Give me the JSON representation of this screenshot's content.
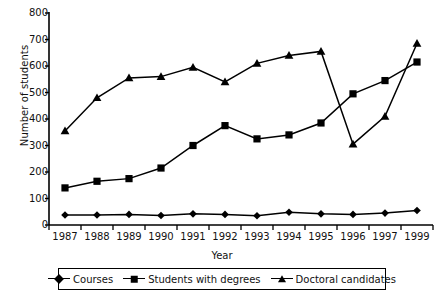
{
  "chart_data": {
    "type": "line",
    "title": "",
    "xlabel": "Year",
    "ylabel": "Number of students",
    "categories": [
      "1987",
      "1988",
      "1989",
      "1990",
      "1991",
      "1992",
      "1993",
      "1994",
      "1995",
      "1996",
      "1997",
      "1999"
    ],
    "ylim": [
      0,
      800
    ],
    "ytick_labels": [
      "0",
      "100",
      "200",
      "300",
      "400",
      "500",
      "600",
      "700",
      "800"
    ],
    "ytick_values": [
      0,
      100,
      200,
      300,
      400,
      500,
      600,
      700,
      800
    ],
    "grid": false,
    "legend_position": "bottom",
    "series": [
      {
        "name": "Courses",
        "marker": "diamond",
        "values": [
          38,
          38,
          40,
          36,
          42,
          40,
          35,
          48,
          42,
          40,
          45,
          55
        ]
      },
      {
        "name": "Students with degrees",
        "marker": "square",
        "values": [
          140,
          165,
          175,
          215,
          300,
          375,
          325,
          340,
          385,
          495,
          545,
          615
        ]
      },
      {
        "name": "Doctoral candidates",
        "marker": "triangle",
        "values": [
          355,
          480,
          555,
          560,
          595,
          540,
          610,
          640,
          655,
          305,
          410,
          685
        ]
      }
    ],
    "colors": {
      "line": "#000000",
      "marker": "#000000",
      "axis": "#000000",
      "background": "#ffffff"
    }
  }
}
